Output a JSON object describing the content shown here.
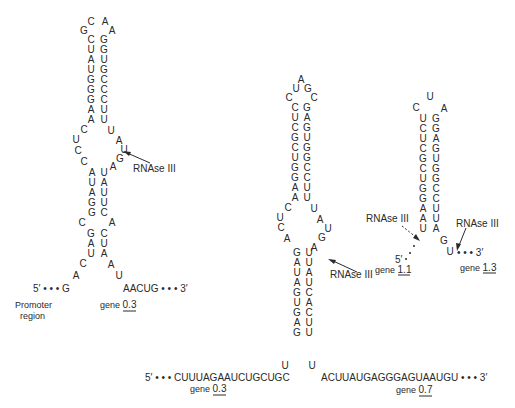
{
  "figure": {
    "structures": [
      {
        "id": "left-hairpin",
        "loop_top": [
          "C",
          "A"
        ],
        "loop_side": [
          "G",
          "A"
        ],
        "upper_stem": [
          [
            "C",
            "G"
          ],
          [
            "U",
            "G"
          ],
          [
            "A",
            "U"
          ],
          [
            "U",
            "G"
          ],
          [
            "G",
            "C"
          ],
          [
            "G",
            "C"
          ],
          [
            "G",
            "C"
          ],
          [
            "A",
            "U"
          ],
          [
            "A",
            "U"
          ]
        ],
        "internal_loop_left": [
          "C",
          "U",
          "C",
          "C"
        ],
        "internal_loop_right": [
          "U",
          "A",
          "U",
          "G",
          "A"
        ],
        "lower_stem": [
          [
            "A",
            "U"
          ],
          [
            "U",
            "A"
          ],
          [
            "A",
            "U"
          ],
          [
            "G",
            "U"
          ],
          [
            "G",
            "C"
          ]
        ],
        "bulge": [
          "C",
          "A"
        ],
        "base_stem": [
          [
            "G",
            "C"
          ],
          [
            "A",
            "U"
          ],
          [
            "U",
            "A"
          ]
        ],
        "tail_left": [
          "C",
          "A"
        ],
        "tail_right": [
          "A",
          "U"
        ],
        "five_prime": "5′ • • • G",
        "three_prime": "AACUG • • • 3′",
        "cleavage_label": "RNAse III",
        "promoter_label_line1": "Promoter",
        "promoter_label_line2": "region",
        "gene_prefix": "gene",
        "gene_number": "0.3"
      },
      {
        "id": "middle-hairpin",
        "loop": [
          "A",
          "U",
          "G",
          "C",
          "C"
        ],
        "upper_stem": [
          [
            "C",
            "G"
          ],
          [
            "U",
            "A"
          ],
          [
            "C",
            "G"
          ],
          [
            "G",
            "U"
          ],
          [
            "C",
            "G"
          ],
          [
            "U",
            "G"
          ],
          [
            "G",
            "C"
          ],
          [
            "G",
            "C"
          ],
          [
            "A",
            "U"
          ],
          [
            "A",
            "U"
          ]
        ],
        "internal_loop_left": [
          "C",
          "U",
          "C",
          "A"
        ],
        "internal_loop_right": [
          "U",
          "A",
          "U",
          "G",
          "A"
        ],
        "lower_stem": [
          [
            "G",
            "U"
          ],
          [
            "A",
            "U"
          ],
          [
            "U",
            "A"
          ],
          [
            "A",
            "U"
          ],
          [
            "G",
            "C"
          ],
          [
            "U",
            "A"
          ],
          [
            "G",
            "C"
          ],
          [
            "A",
            "U"
          ],
          [
            "G",
            "U"
          ]
        ],
        "base_spread": [
          "U",
          "U"
        ],
        "five_prime": "5′ • • • CUUUAGAAUCUGCUGC",
        "three_prime": "ACUUAUGAGGGAGUAAUGU • • • 3′",
        "cleavage_label": "RNAse III",
        "gene_left_prefix": "gene",
        "gene_left_number": "0.3",
        "gene_right_prefix": "gene",
        "gene_right_number": "0.7"
      },
      {
        "id": "right-hairpin",
        "loop": [
          "U",
          "C",
          "A"
        ],
        "stem": [
          [
            "U",
            "G"
          ],
          [
            "C",
            "G"
          ],
          [
            "U",
            "A"
          ],
          [
            "C",
            "G"
          ],
          [
            "G",
            "U"
          ],
          [
            "C",
            "G"
          ],
          [
            "U",
            "G"
          ],
          [
            "G",
            "C"
          ],
          [
            "G",
            "C"
          ],
          [
            "A",
            "U"
          ],
          [
            "A",
            "U"
          ],
          [
            "U",
            "A"
          ]
        ],
        "tail_right": [
          "G",
          "U"
        ],
        "five_prime": "5′",
        "three_prime": "• • • 3′",
        "cleavage_label_left": "RNAse III",
        "cleavage_label_right": "RNAse III",
        "gene_left_prefix": "gene",
        "gene_left_number": "1.1",
        "gene_right_prefix": "gene",
        "gene_right_number": "1.3"
      }
    ]
  }
}
